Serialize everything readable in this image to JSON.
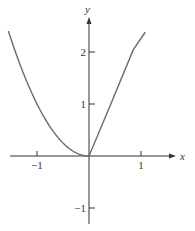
{
  "chart_data": {
    "type": "line",
    "title": "",
    "xlabel": "x",
    "ylabel": "y",
    "xlim": [
      -1.7,
      1.6
    ],
    "ylim": [
      -1.3,
      2.8
    ],
    "grid": false,
    "x_ticks": [
      -1,
      1
    ],
    "x_tick_labels": [
      "−1",
      "1"
    ],
    "y_ticks": [
      2,
      1,
      -1
    ],
    "y_tick_labels": [
      "2",
      "1",
      "−1"
    ],
    "series": [
      {
        "name": "left branch (y = x^2, x ≤ 0)",
        "x": [
          -1.55,
          -1.4,
          -1.2,
          -1.0,
          -0.8,
          -0.6,
          -0.4,
          -0.2,
          0.0
        ],
        "y": [
          2.4,
          1.96,
          1.44,
          1.0,
          0.64,
          0.36,
          0.16,
          0.04,
          0.0
        ]
      },
      {
        "name": "right branch (straight line, x ≥ 0)",
        "x": [
          0.0,
          0.42,
          0.85,
          1.08
        ],
        "y": [
          0.0,
          1.0,
          2.04,
          2.38
        ]
      }
    ],
    "colors": {
      "curve": "#6a6a6a",
      "axis": "#333333"
    },
    "legend": null
  }
}
